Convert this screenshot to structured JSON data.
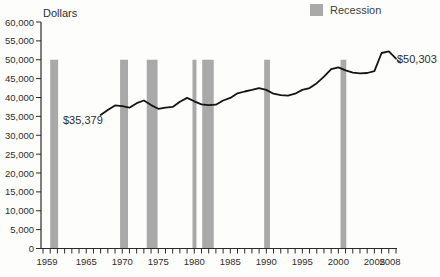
{
  "chart_data": {
    "type": "line",
    "y_axis_title": "Dollars",
    "legend": {
      "label": "Recession",
      "swatch_color": "#a9a9a9"
    },
    "x_range": [
      1959,
      2008
    ],
    "y_range": [
      0,
      60000
    ],
    "y_tick_step": 5000,
    "y_tick_labels": [
      "0",
      "5,000",
      "10,000",
      "15,000",
      "20,000",
      "25,000",
      "30,000",
      "35,000",
      "40,000",
      "45,000",
      "50,000",
      "55,000",
      "60,000"
    ],
    "x_tick_every_year": true,
    "x_labeled_ticks": [
      1959,
      1965,
      1970,
      1975,
      1980,
      1985,
      1990,
      1995,
      2000,
      2005,
      2008
    ],
    "x": [
      1967,
      1968,
      1969,
      1970,
      1971,
      1972,
      1973,
      1974,
      1975,
      1976,
      1977,
      1978,
      1979,
      1980,
      1981,
      1982,
      1983,
      1984,
      1985,
      1986,
      1987,
      1988,
      1989,
      1990,
      1991,
      1992,
      1993,
      1994,
      1995,
      1996,
      1997,
      1998,
      1999,
      2000,
      2001,
      2002,
      2003,
      2004,
      2005,
      2006,
      2007,
      2008
    ],
    "series": [
      {
        "name": "Dollars",
        "values": [
          35379,
          36700,
          37900,
          37700,
          37300,
          38500,
          39200,
          38000,
          37000,
          37300,
          37500,
          38900,
          39900,
          39000,
          38200,
          38000,
          38100,
          39200,
          39900,
          41100,
          41600,
          42000,
          42500,
          42000,
          41000,
          40600,
          40500,
          41000,
          42000,
          42500,
          43800,
          45500,
          47500,
          48000,
          47200,
          46600,
          46400,
          46500,
          47000,
          51800,
          52200,
          50303
        ]
      }
    ],
    "recessions": [
      [
        1960.0,
        1961.1
      ],
      [
        1969.7,
        1970.8
      ],
      [
        1973.4,
        1974.9
      ],
      [
        1979.75,
        1980.3
      ],
      [
        1981.1,
        1982.7
      ],
      [
        1989.7,
        1990.5
      ],
      [
        2000.3,
        2001.1
      ]
    ],
    "recession_bar_top": 50000,
    "annotations": [
      {
        "text": "$35,379",
        "year": 1967,
        "value": 35379
      },
      {
        "text": "$50,303",
        "year": 2008,
        "value": 50303
      }
    ],
    "colors": {
      "line": "#141414",
      "recession_bar": "#a9a9a9",
      "axis": "#2b2b2b",
      "text": "#2e2e2e",
      "background": "#fdfdfc"
    }
  }
}
